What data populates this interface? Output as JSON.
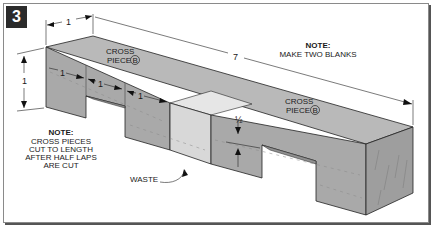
{
  "figure": {
    "step_number": "3",
    "colors": {
      "badge_bg": "#2b2b2b",
      "top_face": "#b9b9b9",
      "front_face": "#a9a9a9",
      "end_face": "#9e9e9e",
      "waste_front": "#d8d8d8",
      "waste_top": "#e6e6e6",
      "frame_border": "#8a8a8a"
    }
  },
  "labels": {
    "cross_piece_left": {
      "line1": "CROSS",
      "line2": "PIECE",
      "ref": "B"
    },
    "cross_piece_right": {
      "line1": "CROSS",
      "line2": "PIECE",
      "ref": "B"
    },
    "waste": "WASTE"
  },
  "notes": {
    "blanks": {
      "title": "NOTE:",
      "lines": [
        "MAKE TWO BLANKS"
      ]
    },
    "cross_pieces": {
      "title": "NOTE:",
      "lines": [
        "CROSS PIECES",
        "CUT TO LENGTH",
        "AFTER HALF LAPS",
        "ARE CUT"
      ]
    }
  },
  "dimensions": {
    "width_top": "1",
    "height_left": "1",
    "overall_length": "7",
    "segment_1": "1",
    "segment_2": "1",
    "segment_3": "1",
    "lap_depth": "½"
  }
}
